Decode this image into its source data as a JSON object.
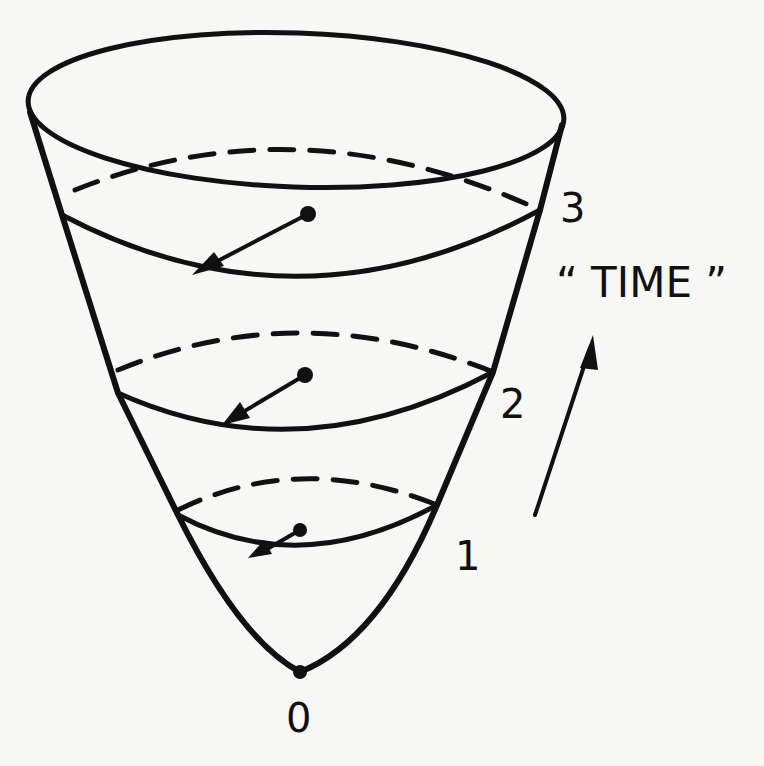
{
  "figure": {
    "colors": {
      "ink": "#111111",
      "paper": "#f7f7f5"
    },
    "slices": [
      {
        "label": "0",
        "kind": "vertex-point"
      },
      {
        "label": "1",
        "kind": "slice",
        "has_arrow": true
      },
      {
        "label": "2",
        "kind": "slice",
        "has_arrow": true
      },
      {
        "label": "3",
        "kind": "slice",
        "has_arrow": true
      }
    ],
    "time_label": "“ TIME ”",
    "time_arrow": {
      "direction": "up",
      "icon": "arrow-up-icon"
    }
  }
}
